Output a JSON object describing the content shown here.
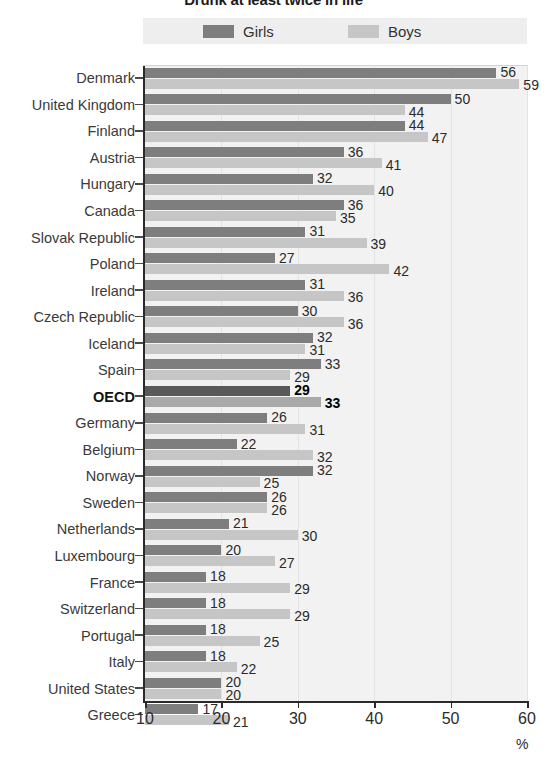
{
  "title": "Drunk at least twice in life",
  "legend": {
    "girls_label": "Girls",
    "boys_label": "Boys",
    "girls_color": "#7e7e7e",
    "boys_color": "#c6c6c6"
  },
  "axis": {
    "unit_label": "%",
    "ticks": [
      10,
      20,
      30,
      40,
      50,
      60
    ],
    "min": 10,
    "max": 60
  },
  "chart_data": {
    "type": "bar",
    "title": "Drunk at least twice in life",
    "xlabel": "%",
    "ylabel": "",
    "xlim": [
      10,
      60
    ],
    "orientation": "horizontal",
    "grid": true,
    "legend_position": "top",
    "categories": [
      "Denmark",
      "United Kingdom",
      "Finland",
      "Austria",
      "Hungary",
      "Canada",
      "Slovak Republic",
      "Poland",
      "Ireland",
      "Czech Republic",
      "Iceland",
      "Spain",
      "OECD",
      "Germany",
      "Belgium",
      "Norway",
      "Sweden",
      "Netherlands",
      "Luxembourg",
      "France",
      "Switzerland",
      "Portugal",
      "Italy",
      "United States",
      "Greece"
    ],
    "highlight_category": "OECD",
    "series": [
      {
        "name": "Girls",
        "color": "#7e7e7e",
        "values": [
          56,
          50,
          44,
          36,
          32,
          36,
          31,
          27,
          31,
          30,
          32,
          33,
          29,
          26,
          22,
          32,
          26,
          21,
          20,
          18,
          18,
          18,
          18,
          20,
          17
        ]
      },
      {
        "name": "Boys",
        "color": "#c6c6c6",
        "values": [
          59,
          44,
          47,
          41,
          40,
          35,
          39,
          42,
          36,
          36,
          31,
          29,
          33,
          31,
          32,
          25,
          26,
          30,
          27,
          29,
          29,
          25,
          22,
          20,
          21
        ]
      }
    ]
  }
}
